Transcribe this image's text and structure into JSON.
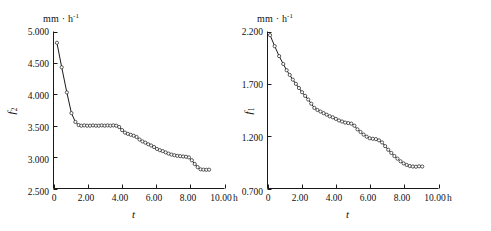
{
  "figure": {
    "panel_count": 2,
    "background_color": "#ffffff",
    "ink_color": "#1a1a1a"
  },
  "chart_data": [
    {
      "type": "line",
      "panel": "left",
      "title": "",
      "unit_label": "mm · h-1",
      "unit_label_base": "mm · h",
      "unit_label_exponent": "-1",
      "xlabel": "t",
      "ylabel": "f2",
      "ylabel_base": "f",
      "ylabel_sub": "2",
      "xunit": "h",
      "xlim": [
        0,
        10
      ],
      "ylim": [
        2.5,
        5.0
      ],
      "xticks": [
        0,
        2,
        4,
        6,
        8,
        10
      ],
      "xticklabels": [
        "0",
        "2.00",
        "4.00",
        "6.00",
        "8.00",
        "10.00"
      ],
      "yticks": [
        2.5,
        3.0,
        3.5,
        4.0,
        4.5,
        5.0
      ],
      "yticklabels": [
        "2.500",
        "3.000",
        "3.500",
        "4.000",
        "4.500",
        "5.000"
      ],
      "grid": false,
      "legend": false,
      "marker": "open-circle",
      "x": [
        0.2,
        0.48,
        0.78,
        1.05,
        1.28,
        1.47,
        1.63,
        1.8,
        1.97,
        2.14,
        2.31,
        2.48,
        2.65,
        2.82,
        2.99,
        3.16,
        3.33,
        3.5,
        3.67,
        3.84,
        4.01,
        4.18,
        4.35,
        4.52,
        4.69,
        4.86,
        5.03,
        5.2,
        5.37,
        5.54,
        5.71,
        5.88,
        6.05,
        6.22,
        6.39,
        6.56,
        6.73,
        6.9,
        7.07,
        7.24,
        7.41,
        7.58,
        7.75,
        7.92,
        8.09,
        8.26,
        8.43,
        8.6,
        8.77,
        8.94,
        9.1
      ],
      "y": [
        4.82,
        4.43,
        4.03,
        3.7,
        3.56,
        3.51,
        3.5,
        3.505,
        3.5,
        3.5,
        3.505,
        3.5,
        3.5,
        3.505,
        3.5,
        3.505,
        3.5,
        3.505,
        3.5,
        3.48,
        3.43,
        3.39,
        3.37,
        3.355,
        3.34,
        3.32,
        3.28,
        3.25,
        3.23,
        3.205,
        3.185,
        3.16,
        3.13,
        3.11,
        3.095,
        3.075,
        3.055,
        3.04,
        3.03,
        3.02,
        3.015,
        3.01,
        3.005,
        2.995,
        2.95,
        2.89,
        2.84,
        2.805,
        2.8,
        2.798,
        2.8
      ]
    },
    {
      "type": "line",
      "panel": "right",
      "title": "",
      "unit_label": "mm · h-1",
      "unit_label_base": "mm · h",
      "unit_label_exponent": "-1",
      "xlabel": "t",
      "ylabel": "f1",
      "ylabel_base": "f",
      "ylabel_sub": "1",
      "xunit": "h",
      "xlim": [
        0,
        10
      ],
      "ylim": [
        0.7,
        2.2
      ],
      "xticks": [
        0,
        2,
        4,
        6,
        8,
        10
      ],
      "xticklabels": [
        "0",
        "2.00",
        "4.00",
        "6.00",
        "8.00",
        "10.00"
      ],
      "yticks": [
        0.7,
        1.2,
        1.7,
        2.2
      ],
      "yticklabels": [
        "0.700",
        "1.200",
        "1.700",
        "2.200"
      ],
      "grid": false,
      "legend": false,
      "marker": "open-circle",
      "x": [
        0.15,
        0.42,
        0.68,
        0.92,
        1.12,
        1.3,
        1.48,
        1.66,
        1.84,
        2.02,
        2.2,
        2.38,
        2.56,
        2.74,
        2.92,
        3.1,
        3.28,
        3.46,
        3.64,
        3.82,
        4.0,
        4.18,
        4.36,
        4.54,
        4.72,
        4.9,
        5.08,
        5.26,
        5.44,
        5.62,
        5.8,
        5.98,
        6.16,
        6.34,
        6.52,
        6.7,
        6.88,
        7.06,
        7.24,
        7.42,
        7.6,
        7.78,
        7.96,
        8.14,
        8.32,
        8.5,
        8.68,
        8.86,
        9.05
      ],
      "y": [
        2.165,
        2.06,
        1.965,
        1.89,
        1.83,
        1.785,
        1.74,
        1.7,
        1.66,
        1.62,
        1.585,
        1.55,
        1.51,
        1.47,
        1.45,
        1.435,
        1.42,
        1.405,
        1.39,
        1.38,
        1.365,
        1.35,
        1.34,
        1.33,
        1.325,
        1.32,
        1.3,
        1.265,
        1.24,
        1.215,
        1.195,
        1.18,
        1.175,
        1.172,
        1.16,
        1.14,
        1.105,
        1.07,
        1.04,
        1.01,
        0.985,
        0.96,
        0.94,
        0.925,
        0.915,
        0.91,
        0.908,
        0.912,
        0.91
      ]
    }
  ]
}
